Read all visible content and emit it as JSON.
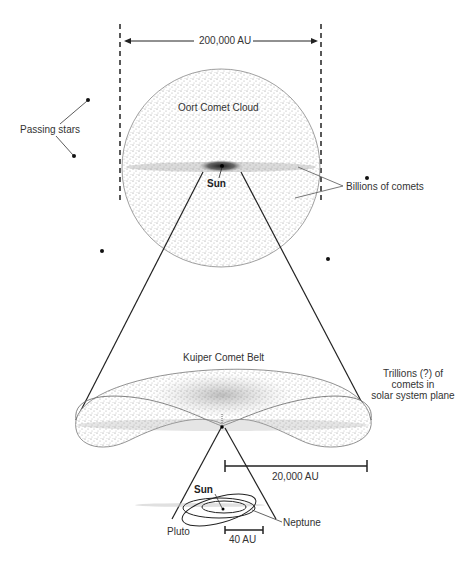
{
  "diagram": {
    "oort": {
      "label": "Oort Comet Cloud",
      "scale_label": "200,000 AU",
      "sun_label": "Sun",
      "comets_label": "Billions of comets",
      "passing_stars_label": "Passing stars"
    },
    "kuiper": {
      "label": "Kuiper Comet Belt",
      "comets_label_lines": [
        "Trillions (?) of",
        "comets in",
        "solar system plane"
      ],
      "scale_label": "20,000 AU"
    },
    "inner": {
      "sun_label": "Sun",
      "pluto_label": "Pluto",
      "neptune_label": "Neptune",
      "scale_label": "40 AU"
    },
    "colors": {
      "ink": "#222222",
      "stipple": "#9a9a9a",
      "background": "#ffffff"
    }
  }
}
